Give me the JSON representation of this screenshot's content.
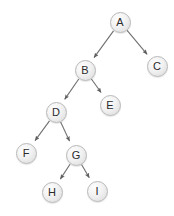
{
  "diagram": {
    "type": "tree",
    "title": "",
    "node_radius": 10.5,
    "colors": {
      "node_fill": "#f0f0f0",
      "node_stroke": "#b8b8b8",
      "edge": "#6f6f6f",
      "label": "#2b2b2b",
      "background": "#ffffff"
    },
    "nodes": [
      {
        "id": "A",
        "label": "A",
        "cx": 120,
        "cy": 22
      },
      {
        "id": "B",
        "label": "B",
        "cx": 85,
        "cy": 70
      },
      {
        "id": "C",
        "label": "C",
        "cx": 157,
        "cy": 66
      },
      {
        "id": "D",
        "label": "D",
        "cx": 56,
        "cy": 112
      },
      {
        "id": "E",
        "label": "E",
        "cx": 110,
        "cy": 105
      },
      {
        "id": "F",
        "label": "F",
        "cx": 26,
        "cy": 153
      },
      {
        "id": "G",
        "label": "G",
        "cx": 76,
        "cy": 155
      },
      {
        "id": "H",
        "label": "H",
        "cx": 52,
        "cy": 192
      },
      {
        "id": "I",
        "label": "I",
        "cx": 97,
        "cy": 191
      }
    ],
    "edges": [
      {
        "from": "A",
        "to": "B",
        "arrow": true
      },
      {
        "from": "A",
        "to": "C",
        "arrow": true
      },
      {
        "from": "B",
        "to": "D",
        "arrow": true
      },
      {
        "from": "B",
        "to": "E",
        "arrow": true
      },
      {
        "from": "D",
        "to": "F",
        "arrow": true
      },
      {
        "from": "D",
        "to": "G",
        "arrow": true
      },
      {
        "from": "G",
        "to": "H",
        "arrow": true
      },
      {
        "from": "G",
        "to": "I",
        "arrow": true
      }
    ]
  }
}
